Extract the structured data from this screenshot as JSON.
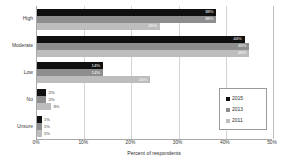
{
  "chart_data": {
    "type": "bar",
    "orientation": "horizontal",
    "title": "",
    "xlabel": "Percent of respondents",
    "ylabel": "",
    "xlim": [
      0,
      50
    ],
    "xticks": [
      "0%",
      "10%",
      "20%",
      "30%",
      "40%",
      "50%"
    ],
    "xtick_values": [
      0,
      10,
      20,
      30,
      40,
      50
    ],
    "grid": true,
    "legend_position": "lower-right",
    "categories": [
      "High",
      "Moderate",
      "Low",
      "No",
      "Unsure"
    ],
    "series": [
      {
        "name": "2015",
        "color": "#101010",
        "values": [
          38,
          44,
          14,
          2,
          1
        ],
        "labels": [
          "38%",
          "44%",
          "14%",
          "2%",
          "1%"
        ]
      },
      {
        "name": "2013",
        "color": "#8e8e8e",
        "values": [
          38,
          45,
          14,
          2,
          1
        ],
        "labels": [
          "38%",
          "45%",
          "14%",
          "2%",
          "1%"
        ]
      },
      {
        "name": "2011",
        "color": "#bdbdbd",
        "values": [
          26,
          45,
          24,
          3,
          1
        ],
        "labels": [
          "26%",
          "45%",
          "24%",
          "3%",
          "1%"
        ]
      }
    ]
  },
  "legend": {
    "items": [
      {
        "label": "2015"
      },
      {
        "label": "2013"
      },
      {
        "label": "2011"
      }
    ]
  }
}
